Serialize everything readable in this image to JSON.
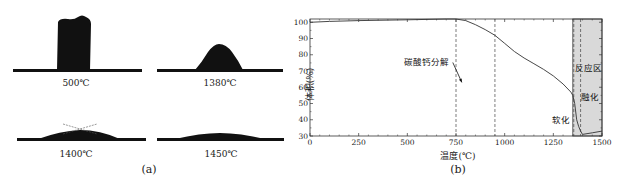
{
  "panel_a": {
    "caption": "(a)",
    "shapes": [
      {
        "label": "500℃",
        "form": "tall-block"
      },
      {
        "label": "1380℃",
        "form": "hemisphere-trapezoid"
      },
      {
        "label": "1400℃",
        "form": "flattened-with-contact-angle-lines"
      },
      {
        "label": "1450℃",
        "form": "fully-spread"
      }
    ]
  },
  "panel_b": {
    "caption": "(b)",
    "annotations": {
      "decomposition": "碳酸钙分解",
      "reaction_zone": "反应区",
      "melting": "融化",
      "softening": "软化"
    }
  },
  "chart_data": {
    "type": "line",
    "title": "",
    "xlabel": "温度(℃)",
    "ylabel": "体积(%)",
    "xlim": [
      0,
      1500
    ],
    "ylim": [
      30,
      102
    ],
    "xticks": [
      0,
      250,
      500,
      750,
      1000,
      1250,
      1500
    ],
    "yticks": [
      30,
      40,
      50,
      60,
      70,
      80,
      90,
      100
    ],
    "grid": false,
    "legend": null,
    "series": [
      {
        "name": "体积",
        "x": [
          0,
          100,
          250,
          500,
          700,
          750,
          800,
          850,
          900,
          950,
          1000,
          1050,
          1100,
          1150,
          1200,
          1250,
          1300,
          1340,
          1350,
          1360,
          1370,
          1380,
          1390,
          1400,
          1450,
          1500
        ],
        "y": [
          100,
          100.5,
          101,
          101.5,
          102,
          102,
          101,
          98.5,
          95.5,
          92,
          87,
          82,
          78,
          74.5,
          71,
          67,
          62,
          57,
          55,
          50,
          40,
          36,
          33,
          31,
          32,
          33
        ]
      }
    ],
    "vertical_dashed_lines": [
      750,
      950,
      1355,
      1390
    ],
    "shaded_region": {
      "x_from": 1350,
      "x_to": 1500,
      "label": "反应区"
    },
    "annotations": [
      {
        "text": "碳酸钙分解",
        "x": 600,
        "y": 74,
        "arrow_to": [
          780,
          63
        ]
      },
      {
        "text": "反应区",
        "x": 1430,
        "y": 70
      },
      {
        "text": "融化",
        "x": 1440,
        "y": 52
      },
      {
        "text": "软化",
        "x": 1290,
        "y": 38
      }
    ]
  }
}
